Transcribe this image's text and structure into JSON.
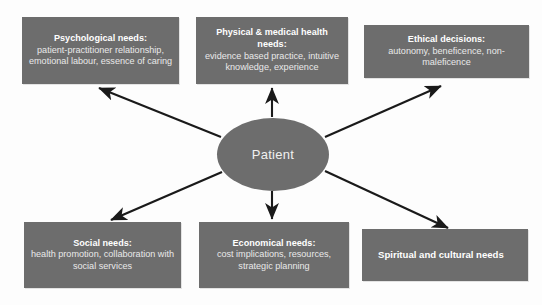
{
  "diagram": {
    "center": {
      "label": "Patient",
      "shape": "ellipse",
      "fill": "#6d6d6d",
      "text_color": "#f0f0f0"
    },
    "style": {
      "box_fill": "#6d6d6d",
      "box_text": "#e9e9e9",
      "box_lead_text": "#ffffff",
      "arrow_color": "#1a1a1a",
      "background": "#fdfdfd"
    },
    "nodes": [
      {
        "id": "psychological",
        "lead": "Psychological needs:",
        "body": "patient-practitioner relationship, emotional labour, essence of caring",
        "position": "top-left"
      },
      {
        "id": "physical",
        "lead": "Physical & medical health needs:",
        "body": "evidence based practice, intuitive knowledge, experience",
        "position": "top-center"
      },
      {
        "id": "ethical",
        "lead": "Ethical decisions:",
        "body": "autonomy, beneficence, non-maleficence",
        "position": "top-right"
      },
      {
        "id": "social",
        "lead": "Social needs:",
        "body": "health promotion, collaboration with social services",
        "position": "bottom-left"
      },
      {
        "id": "economical",
        "lead": "Economical needs:",
        "body": "cost implications, resources, strategic planning",
        "position": "bottom-center"
      },
      {
        "id": "spiritual",
        "lead": "Spiritual and cultural needs",
        "body": "",
        "position": "bottom-right"
      }
    ],
    "edges": [
      {
        "from": "Patient",
        "to": "Psychological needs",
        "direction": "outward"
      },
      {
        "from": "Patient",
        "to": "Physical & medical health needs",
        "direction": "outward"
      },
      {
        "from": "Patient",
        "to": "Ethical decisions",
        "direction": "outward"
      },
      {
        "from": "Patient",
        "to": "Social needs",
        "direction": "outward"
      },
      {
        "from": "Patient",
        "to": "Economical needs",
        "direction": "outward"
      },
      {
        "from": "Patient",
        "to": "Spiritual and cultural needs",
        "direction": "outward"
      }
    ]
  }
}
